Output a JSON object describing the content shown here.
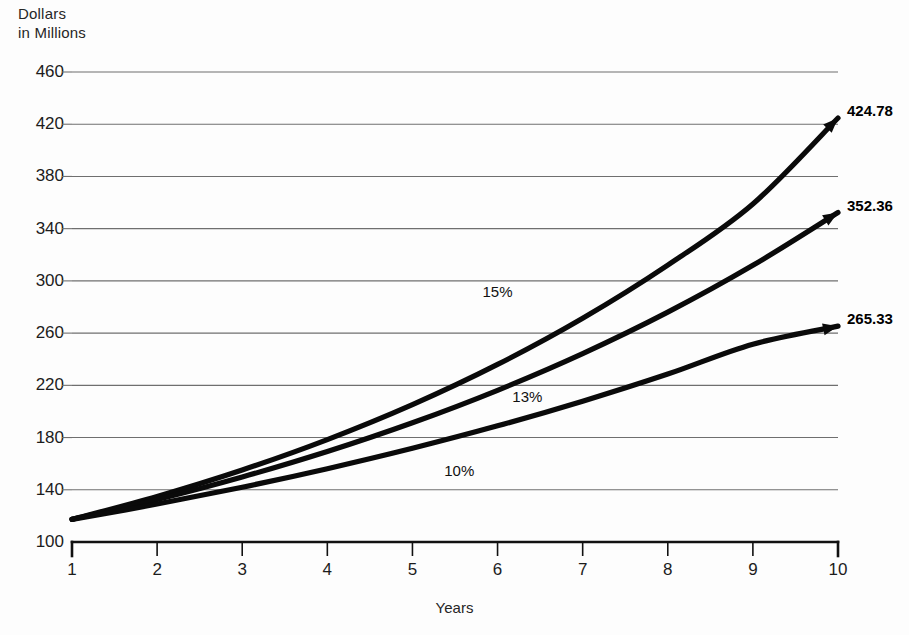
{
  "chart_data": {
    "type": "line",
    "title": "",
    "ylabel": "Dollars\nin Millions",
    "xlabel": "Years",
    "grid": true,
    "legend_position": "inline-annotations",
    "x": [
      1,
      2,
      3,
      4,
      5,
      6,
      7,
      8,
      9,
      10
    ],
    "xticklabels": [
      "1",
      "2",
      "3",
      "4",
      "5",
      "6",
      "7",
      "8",
      "9",
      "10"
    ],
    "yticklabels": [
      "100",
      "140",
      "180",
      "220",
      "260",
      "300",
      "340",
      "380",
      "420",
      "460"
    ],
    "ytickvalues": [
      100,
      140,
      180,
      220,
      260,
      300,
      340,
      380,
      420,
      460
    ],
    "ylim": [
      100,
      460
    ],
    "xlim": [
      1,
      10
    ],
    "series": [
      {
        "name": "15%",
        "rate_percent": 15,
        "annotation": "15%",
        "annotation_x": 6.0,
        "annotation_y": 292,
        "end_label": "424.78",
        "values": [
          117.33,
          134.93,
          155.17,
          178.45,
          205.21,
          236.0,
          271.4,
          312.11,
          358.93,
          424.78
        ]
      },
      {
        "name": "13%",
        "rate_percent": 13,
        "annotation": "13%",
        "annotation_x": 6.35,
        "annotation_y": 212,
        "end_label": "352.36",
        "values": [
          117.33,
          132.58,
          149.82,
          169.3,
          191.31,
          216.18,
          244.28,
          276.03,
          311.91,
          352.36
        ]
      },
      {
        "name": "10%",
        "rate_percent": 10,
        "annotation": "10%",
        "annotation_x": 5.55,
        "annotation_y": 155,
        "end_label": "265.33",
        "values": [
          117.33,
          129.06,
          141.97,
          156.17,
          171.78,
          188.96,
          207.86,
          228.64,
          251.51,
          265.33
        ]
      }
    ]
  },
  "colors": {
    "series_stroke": "#0a0a0a",
    "grid": "#6f6f6f",
    "axis": "#111111",
    "background": "#fdfdfd",
    "text": "#1c1c1c"
  }
}
